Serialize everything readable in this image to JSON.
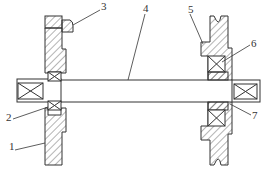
{
  "diagram": {
    "type": "mechanical-assembly-cross-section",
    "stroke_color": "#333333",
    "background": "#ffffff",
    "labels": [
      {
        "id": "1",
        "text": "1",
        "part": "left-plate",
        "x": 9,
        "y": 146
      },
      {
        "id": "2",
        "text": "2",
        "part": "left-bearing",
        "x": 6,
        "y": 115
      },
      {
        "id": "3",
        "text": "3",
        "part": "top-cap",
        "x": 101,
        "y": 4
      },
      {
        "id": "4",
        "text": "4",
        "part": "shaft",
        "x": 143,
        "y": 6
      },
      {
        "id": "5",
        "text": "5",
        "part": "pulley",
        "x": 188,
        "y": 7
      },
      {
        "id": "6",
        "text": "6",
        "part": "right-bearing-upper",
        "x": 252,
        "y": 40
      },
      {
        "id": "7",
        "text": "7",
        "part": "right-bearing-lower",
        "x": 253,
        "y": 112
      }
    ]
  }
}
